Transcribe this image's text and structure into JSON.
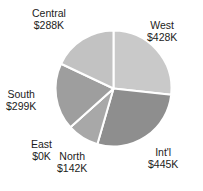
{
  "chart_data": {
    "type": "pie",
    "title": "",
    "categories": [
      "West",
      "Int'l",
      "North",
      "East",
      "South",
      "Central"
    ],
    "values": [
      428,
      445,
      142,
      0,
      299,
      288
    ],
    "value_labels": [
      "$428K",
      "$445K",
      "$142K",
      "$0K",
      "$299K",
      "$288K"
    ],
    "unit": "K",
    "total": 1602,
    "start_angle_deg": 0,
    "direction": "clockwise",
    "legend": "none",
    "labels_position": "outside",
    "slice_border_color": "#ffffff",
    "slice_border_width": 2,
    "slices": [
      {
        "name": "West",
        "value": 428,
        "value_label": "$428K",
        "percent": 26.7,
        "angle_deg": 96.2,
        "color": "#c9c9c9"
      },
      {
        "name": "Int'l",
        "value": 445,
        "value_label": "$445K",
        "percent": 27.8,
        "angle_deg": 100.0,
        "color": "#8e8e8e"
      },
      {
        "name": "North",
        "value": 142,
        "value_label": "$142K",
        "percent": 8.9,
        "angle_deg": 31.9,
        "color": "#a8a8a8"
      },
      {
        "name": "East",
        "value": 0,
        "value_label": "$0K",
        "percent": 0.0,
        "angle_deg": 0.0,
        "color": "#bdbdbd"
      },
      {
        "name": "South",
        "value": 299,
        "value_label": "$299K",
        "percent": 18.7,
        "angle_deg": 67.2,
        "color": "#9e9e9e"
      },
      {
        "name": "Central",
        "value": 288,
        "value_label": "$288K",
        "percent": 18.0,
        "angle_deg": 64.7,
        "color": "#c2c2c2"
      }
    ]
  },
  "labels": {
    "central": {
      "name": "Central",
      "value": "$288K"
    },
    "west": {
      "name": "West",
      "value": "$428K"
    },
    "south": {
      "name": "South",
      "value": "$299K"
    },
    "east": {
      "name": "East",
      "value": "$0K"
    },
    "north": {
      "name": "North",
      "value": "$142K"
    },
    "intl": {
      "name": "Int'l",
      "value": "$445K"
    }
  },
  "geometry": {
    "cx": 113.5,
    "cy": 88.5,
    "r": 58
  }
}
